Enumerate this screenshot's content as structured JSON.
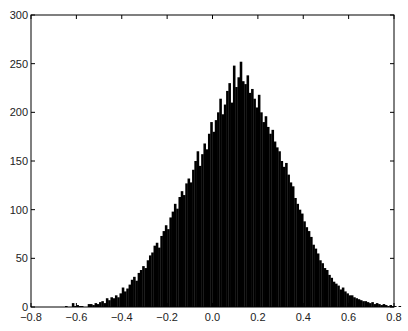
{
  "chart_data": {
    "type": "bar",
    "subtype": "histogram",
    "title": "",
    "xlabel": "",
    "ylabel": "",
    "xlim": [
      -0.8,
      0.8
    ],
    "ylim": [
      0,
      300
    ],
    "xticks": [
      -0.8,
      -0.6,
      -0.4,
      -0.2,
      0.0,
      0.2,
      0.4,
      0.6,
      0.8
    ],
    "xtick_labels": [
      "-0.8",
      "-0.6",
      "-0.4",
      "-0.2",
      "0.0",
      "0.2",
      "0.4",
      "0.6",
      "0.8"
    ],
    "yticks": [
      0,
      50,
      100,
      150,
      200,
      250,
      300
    ],
    "ytick_labels": [
      "0",
      "50",
      "100",
      "150",
      "200",
      "250",
      "300"
    ],
    "grid": false,
    "legend": null,
    "bar_color": "#000000",
    "bin_start": -0.65,
    "bin_width": 0.01,
    "counts": [
      1,
      0,
      0,
      4,
      1,
      2,
      1,
      1,
      0,
      0,
      3,
      3,
      2,
      4,
      3,
      5,
      6,
      4,
      9,
      7,
      10,
      9,
      12,
      10,
      14,
      20,
      16,
      19,
      23,
      28,
      31,
      27,
      35,
      38,
      42,
      40,
      48,
      53,
      56,
      63,
      66,
      61,
      73,
      78,
      84,
      80,
      92,
      98,
      106,
      101,
      113,
      119,
      115,
      127,
      132,
      128,
      141,
      150,
      160,
      145,
      157,
      168,
      162,
      178,
      190,
      180,
      192,
      200,
      214,
      198,
      208,
      222,
      230,
      210,
      248,
      226,
      236,
      252,
      232,
      229,
      238,
      220,
      224,
      214,
      205,
      218,
      200,
      190,
      196,
      185,
      178,
      182,
      170,
      164,
      160,
      150,
      144,
      148,
      136,
      128,
      124,
      112,
      106,
      100,
      96,
      88,
      82,
      78,
      72,
      64,
      60,
      55,
      48,
      45,
      40,
      38,
      33,
      30,
      26,
      24,
      22,
      18,
      20,
      16,
      14,
      12,
      12,
      10,
      9,
      8,
      7,
      6,
      6,
      5,
      4,
      5,
      3,
      4,
      3,
      2,
      3,
      2,
      1,
      2,
      1,
      1,
      0,
      1,
      0,
      0
    ]
  },
  "axes": {
    "frame": "box",
    "tick_direction": "in"
  }
}
